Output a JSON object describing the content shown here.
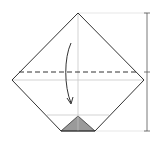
{
  "diagram": {
    "title": "Origami fold step: fold top corner down along dashed valley line",
    "colors": {
      "outline": "#333333",
      "guide": "#c8c8c8",
      "shade": "#9a9a9a",
      "scale": "#555555"
    },
    "shape": {
      "top": [
        78,
        13
      ],
      "left": [
        12,
        80
      ],
      "right": [
        144,
        80
      ],
      "bottom_left": [
        61,
        131
      ],
      "bottom_right": [
        95,
        131
      ]
    },
    "fold_line": {
      "type": "valley-dashed",
      "y": 72,
      "x1": 19,
      "x2": 137
    },
    "guides": {
      "center_vertical_x": 78,
      "mid_horizontal_y": 80,
      "lower_horizontal_y": 115
    },
    "shaded_triangle": {
      "apex": [
        78,
        116
      ],
      "base_left": [
        61,
        131
      ],
      "base_right": [
        95,
        131
      ]
    },
    "arrow": {
      "direction": "down",
      "meaning": "fold-down"
    },
    "scale_bar": {
      "x": 147,
      "top": 13,
      "mid": 72,
      "bottom": 131,
      "ticks": 3
    }
  }
}
